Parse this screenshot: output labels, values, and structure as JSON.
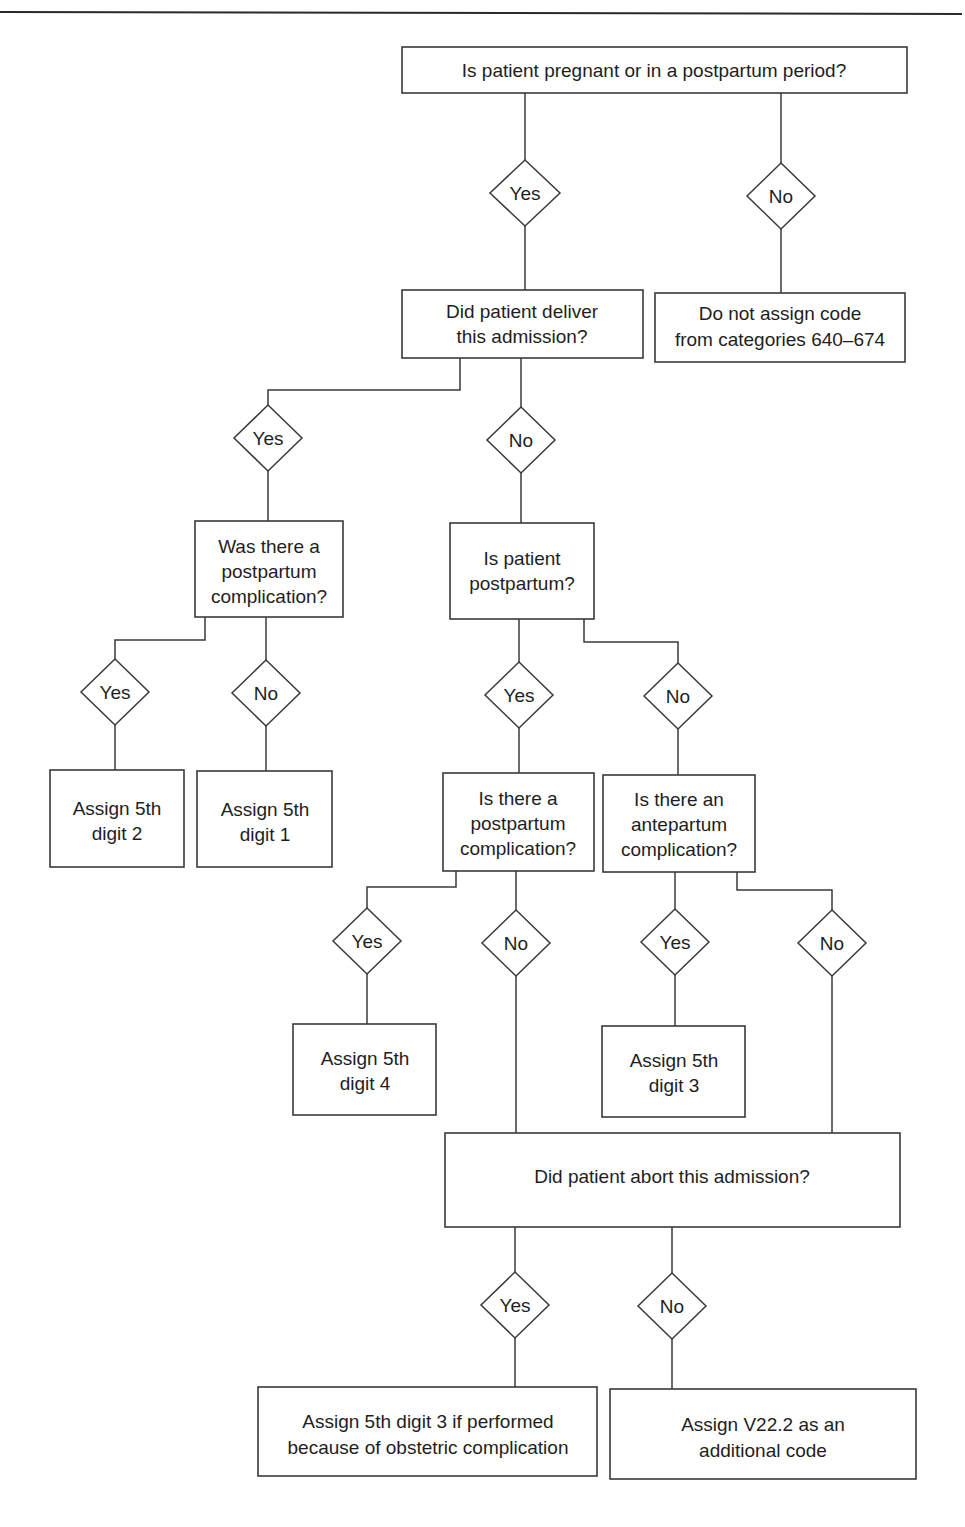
{
  "diagram": {
    "type": "decision-flowchart",
    "nodes": {
      "q_pregnant": {
        "lines": [
          "Is patient pregnant or in a postpartum period?"
        ]
      },
      "q_deliver": {
        "lines": [
          "Did patient deliver",
          "this admission?"
        ]
      },
      "r_no_code": {
        "lines": [
          "Do not assign code",
          "from categories 640–674"
        ]
      },
      "q_was_pp_comp": {
        "lines": [
          "Was there a",
          "postpartum",
          "complication?"
        ]
      },
      "q_is_pp": {
        "lines": [
          "Is patient",
          "postpartum?"
        ]
      },
      "r_digit2": {
        "lines": [
          "Assign 5th",
          "digit 2"
        ]
      },
      "r_digit1": {
        "lines": [
          "Assign 5th",
          "digit 1"
        ]
      },
      "q_is_pp_comp": {
        "lines": [
          "Is there a",
          "postpartum",
          "complication?"
        ]
      },
      "q_ante_comp": {
        "lines": [
          "Is there an",
          "antepartum",
          "complication?"
        ]
      },
      "r_digit4": {
        "lines": [
          "Assign 5th",
          "digit 4"
        ]
      },
      "r_digit3": {
        "lines": [
          "Assign 5th",
          "digit 3"
        ]
      },
      "q_abort": {
        "lines": [
          "Did patient abort this admission?"
        ]
      },
      "r_abort_yes": {
        "lines": [
          "Assign 5th digit 3 if performed",
          "because of obstetric complication"
        ]
      },
      "r_v222": {
        "lines": [
          "Assign V22.2 as an",
          "additional code"
        ]
      }
    },
    "decisions": {
      "d1_yes": "Yes",
      "d1_no": "No",
      "d2_yes": "Yes",
      "d2_no": "No",
      "d3_yes": "Yes",
      "d3_no": "No",
      "d4_yes": "Yes",
      "d4_no": "No",
      "d5_yes": "Yes",
      "d5_no": "No",
      "d6_yes": "Yes",
      "d6_no": "No",
      "d7_yes": "Yes",
      "d7_no": "No"
    },
    "edges": [
      {
        "from": "q_pregnant",
        "label": "Yes",
        "to": "q_deliver"
      },
      {
        "from": "q_pregnant",
        "label": "No",
        "to": "r_no_code"
      },
      {
        "from": "q_deliver",
        "label": "Yes",
        "to": "q_was_pp_comp"
      },
      {
        "from": "q_deliver",
        "label": "No",
        "to": "q_is_pp"
      },
      {
        "from": "q_was_pp_comp",
        "label": "Yes",
        "to": "r_digit2"
      },
      {
        "from": "q_was_pp_comp",
        "label": "No",
        "to": "r_digit1"
      },
      {
        "from": "q_is_pp",
        "label": "Yes",
        "to": "q_is_pp_comp"
      },
      {
        "from": "q_is_pp",
        "label": "No",
        "to": "q_ante_comp"
      },
      {
        "from": "q_is_pp_comp",
        "label": "Yes",
        "to": "r_digit4"
      },
      {
        "from": "q_is_pp_comp",
        "label": "No",
        "to": "q_abort"
      },
      {
        "from": "q_ante_comp",
        "label": "Yes",
        "to": "r_digit3"
      },
      {
        "from": "q_ante_comp",
        "label": "No",
        "to": "q_abort"
      },
      {
        "from": "q_abort",
        "label": "Yes",
        "to": "r_abort_yes"
      },
      {
        "from": "q_abort",
        "label": "No",
        "to": "r_v222"
      }
    ]
  }
}
